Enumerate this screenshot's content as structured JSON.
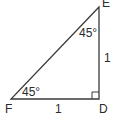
{
  "figure": {
    "type": "right-triangle",
    "stroke_color": "#3a3a3a",
    "vertices": [
      {
        "name": "E",
        "x": 99,
        "y": 7
      },
      {
        "name": "F",
        "x": 11,
        "y": 99
      },
      {
        "name": "D",
        "x": 99,
        "y": 99
      }
    ],
    "labels": {
      "vertex_e": "E",
      "vertex_f": "F",
      "vertex_d": "D",
      "side_fd": "1",
      "side_de": "1",
      "angle_e": "45°",
      "angle_f": "45°"
    },
    "right_angle_at": "D"
  }
}
